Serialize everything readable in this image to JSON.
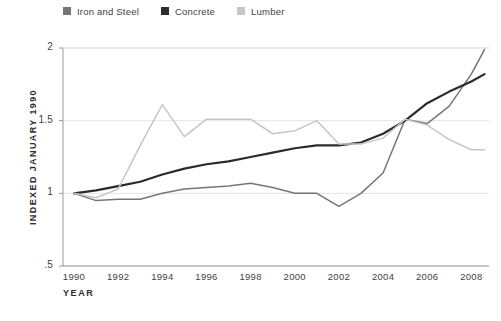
{
  "chart_data": {
    "type": "line",
    "title": "",
    "xlabel": "YEAR",
    "ylabel": "INDEXED JANUARY 1990",
    "xlim": [
      1989.5,
      2008.8
    ],
    "ylim": [
      0.5,
      2.0
    ],
    "grid": true,
    "legend_position": "top-left",
    "x_ticks": [
      "1990",
      "1992",
      "1994",
      "1996",
      "1998",
      "2000",
      "2002",
      "2004",
      "2006",
      "2008"
    ],
    "x_tick_values": [
      1990,
      1992,
      1994,
      1996,
      1998,
      2000,
      2002,
      2004,
      2006,
      2008
    ],
    "y_ticks": [
      "2",
      "1.5",
      "1",
      ".5"
    ],
    "y_tick_values": [
      2,
      1.5,
      1,
      0.5
    ],
    "x": [
      1990,
      1991,
      1992,
      1993,
      1994,
      1995,
      1996,
      1997,
      1998,
      1999,
      2000,
      2001,
      2002,
      2003,
      2004,
      2005,
      2006,
      2007,
      2008,
      2008.6
    ],
    "series": [
      {
        "name": "Iron and Steel",
        "color": "#767676",
        "values": [
          1.0,
          0.95,
          0.96,
          0.96,
          1.0,
          1.03,
          1.04,
          1.05,
          1.07,
          1.04,
          1.0,
          1.0,
          0.91,
          1.0,
          1.14,
          1.51,
          1.48,
          1.6,
          1.82,
          1.99
        ]
      },
      {
        "name": "Concrete",
        "color": "#2b2b2b",
        "values": [
          1.0,
          1.02,
          1.05,
          1.08,
          1.13,
          1.17,
          1.2,
          1.22,
          1.25,
          1.28,
          1.31,
          1.33,
          1.33,
          1.35,
          1.41,
          1.5,
          1.62,
          1.7,
          1.77,
          1.82
        ]
      },
      {
        "name": "Lumber",
        "color": "#c6c6c6",
        "values": [
          1.0,
          0.97,
          1.03,
          1.33,
          1.61,
          1.39,
          1.51,
          1.51,
          1.51,
          1.41,
          1.43,
          1.5,
          1.34,
          1.34,
          1.38,
          1.51,
          1.47,
          1.37,
          1.3,
          1.3
        ]
      }
    ]
  },
  "legend": {
    "items": [
      {
        "label": "Iron and Steel",
        "color": "#767676"
      },
      {
        "label": "Concrete",
        "color": "#2b2b2b"
      },
      {
        "label": "Lumber",
        "color": "#c6c6c6"
      }
    ]
  },
  "axes": {
    "y_title": "INDEXED JANUARY 1990",
    "x_title": "YEAR",
    "y_tick_labels": [
      "2",
      "1.5",
      "1",
      ".5"
    ],
    "x_tick_labels": [
      "1990",
      "1992",
      "1994",
      "1996",
      "1998",
      "2000",
      "2002",
      "2004",
      "2006",
      "2008"
    ]
  },
  "colors": {
    "background": "#ffffff",
    "grid": "#e4e4e4",
    "axis": "#9a9a9a",
    "text": "#3f3f3f"
  }
}
